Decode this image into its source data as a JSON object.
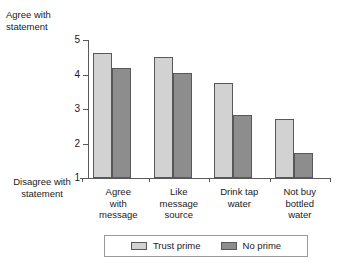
{
  "chart_data": {
    "type": "bar",
    "title": "",
    "xlabel": "",
    "ylabel": "",
    "ylim": [
      1,
      5
    ],
    "yticks": [
      1,
      2,
      3,
      4,
      5
    ],
    "ytick_labels": [
      "1",
      "2",
      "3",
      "4",
      "5"
    ],
    "grid": false,
    "legend_position": "bottom",
    "axis_top_label": "Agree with\nstatement",
    "axis_bottom_label": "Disagree with\nstatement",
    "categories": [
      "Agree\nwith\nmessage",
      "Like\nmessage\nsource",
      "Drink tap\nwater",
      "Not buy\nbottled\nwater"
    ],
    "series": [
      {
        "name": "Trust prime",
        "color": "#d2d2d2",
        "values": [
          4.62,
          4.5,
          3.75,
          2.7
        ]
      },
      {
        "name": "No prime",
        "color": "#8d8d8d",
        "values": [
          4.18,
          4.03,
          2.82,
          1.72
        ]
      }
    ]
  },
  "legend": {
    "entries": [
      {
        "label": "Trust prime",
        "swatch": "light"
      },
      {
        "label": "No prime",
        "swatch": "dark"
      }
    ]
  }
}
